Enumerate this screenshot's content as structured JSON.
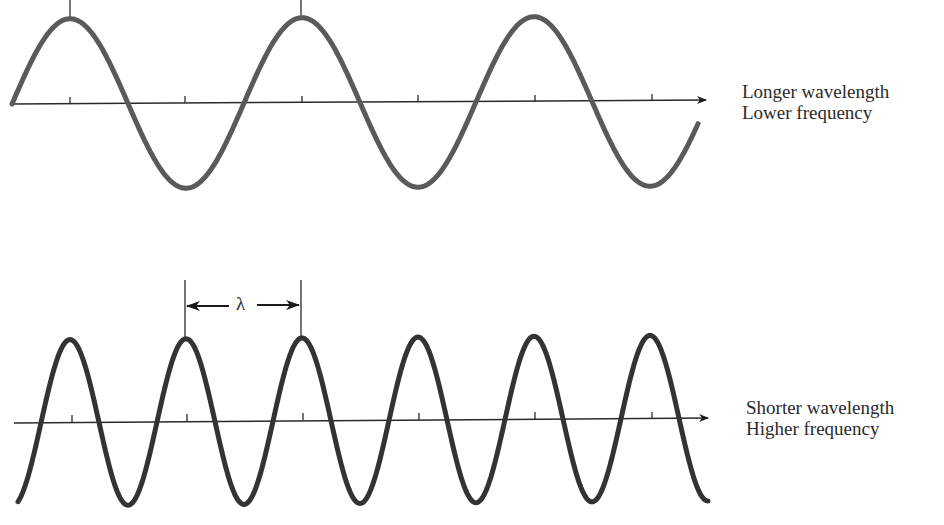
{
  "top_panel": {
    "label_line1": "Longer wavelength",
    "label_line2": "Lower frequency",
    "wavelength_px": 232,
    "cycles_shown": 3,
    "stroke_color": "#5a5a5a"
  },
  "bottom_panel": {
    "label_line1": "Shorter wavelength",
    "label_line2": "Higher frequency",
    "wavelength_px": 116,
    "cycles_shown": 6,
    "stroke_color": "#333333",
    "wavelength_marker": {
      "symbol": "λ"
    }
  },
  "colors": {
    "axis": "#2a2a2a",
    "text": "#2a2a2a",
    "background": "#ffffff"
  }
}
